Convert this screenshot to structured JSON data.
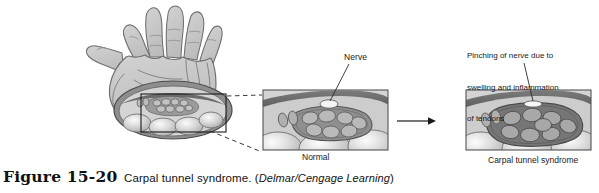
{
  "figure": {
    "number": "Figure 15-20",
    "title": "Carpal tunnel syndrome.",
    "credit": "Delmar/Cengage Learning",
    "paren_open": "(",
    "paren_close": ")"
  },
  "annotations": {
    "nerve": "Nerve",
    "pinching_line1": "Pinching of nerve due to",
    "pinching_line2": "swelling and inflammation",
    "pinching_line3": "of tendons"
  },
  "panels": {
    "normal": {
      "caption": "Normal"
    },
    "syndrome": {
      "caption": "Carpal tunnel syndrome"
    }
  },
  "icons": {
    "hand": "hand-palm-illustration",
    "wrist_section": "wrist-cross-section",
    "callout_box": "callout-rectangle",
    "dashed_leader_upper": "dashed-leader-line",
    "dashed_leader_lower": "dashed-leader-line",
    "transition_arrow": "right-arrow-icon",
    "nerve_leader": "leader-line",
    "pinching_leader": "leader-line"
  },
  "colors": {
    "skin_fill": "#c9c9c9",
    "skin_outline": "#6e6e6e",
    "ligament_dark": "#6b6b6b",
    "panel_bg": "#d4d4d4",
    "tendon_fill": "#b4b4b4",
    "tendon_outline": "#6b6b6b",
    "tunnel_mass": "#8f8f8f",
    "tunnel_mass_swollen": "#767676",
    "bone_fill": "#d8d8d8",
    "nerve_fill": "#f2f2f2",
    "panel_border": "#555555",
    "text": "#1a1a1a"
  }
}
